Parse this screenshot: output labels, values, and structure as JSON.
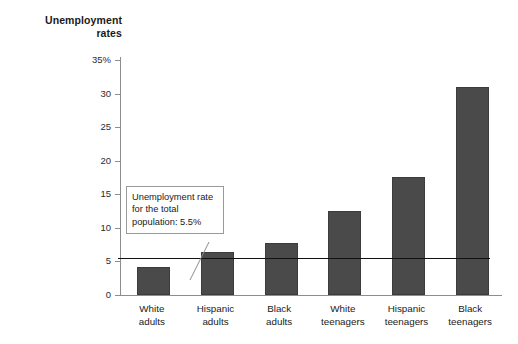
{
  "chart_data": {
    "type": "bar",
    "title": "Unemployment\nrates",
    "xlabel": "",
    "ylabel": "Unemployment rates",
    "ylim": [
      0,
      35
    ],
    "grid": false,
    "legend": false,
    "categories": [
      "White\nadults",
      "Hispanic\nadults",
      "Black\nadults",
      "White\nteenagers",
      "Hispanic\nteenagers",
      "Black\nteenagers"
    ],
    "values": [
      4.2,
      6.4,
      7.8,
      12.5,
      17.6,
      31.0
    ],
    "ytick_labels": [
      "35%",
      "30",
      "25",
      "20",
      "15",
      "10",
      "5",
      "0"
    ],
    "ytick_values": [
      35,
      30,
      25,
      20,
      15,
      10,
      5,
      0
    ],
    "annotations": [
      {
        "text": "Unemployment rate for the total population: 5.5%",
        "value": 5.5,
        "type": "reference-line-callout"
      }
    ],
    "colors": {
      "bar_fill": "#4a4a4a",
      "bar_edge": "#3c3c3c",
      "axis": "#8d8d8d",
      "reference_line": "#111111",
      "callout_border": "#9a9a9a",
      "background": "#ffffff",
      "text": "#1a1a1a"
    }
  }
}
